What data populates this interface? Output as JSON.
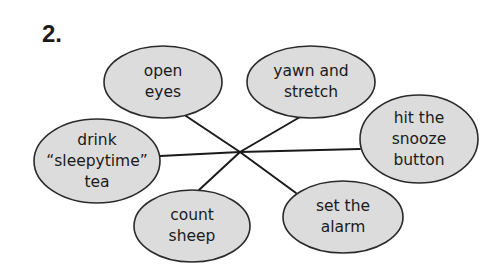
{
  "exercise": {
    "number": "2."
  },
  "colors": {
    "background": "#ffffff",
    "node_fill": "#dcdcdc",
    "node_stroke": "#2a2a2a",
    "line": "#1a1a1a",
    "text": "#1a1a1a"
  },
  "center": {
    "x": 240,
    "y": 152
  },
  "nodes": [
    {
      "id": "open-eyes",
      "lines": [
        "open",
        "eyes"
      ],
      "cx": 163,
      "cy": 82,
      "rx": 59,
      "ry": 36,
      "connect": {
        "x": 186,
        "y": 116
      }
    },
    {
      "id": "yawn-and-stretch",
      "lines": [
        "yawn and",
        "stretch"
      ],
      "cx": 311,
      "cy": 82,
      "rx": 64,
      "ry": 36,
      "connect": {
        "x": 300,
        "y": 117
      }
    },
    {
      "id": "drink-sleepytime-tea",
      "lines": [
        "drink",
        "“sleepytime”",
        "tea"
      ],
      "cx": 97,
      "cy": 161,
      "rx": 63,
      "ry": 42,
      "connect": {
        "x": 160,
        "y": 156
      }
    },
    {
      "id": "hit-the-snooze-button",
      "lines": [
        "hit the",
        "snooze",
        "button"
      ],
      "cx": 419,
      "cy": 139,
      "rx": 59,
      "ry": 44,
      "connect": {
        "x": 360,
        "y": 149
      }
    },
    {
      "id": "count-sheep",
      "lines": [
        "count",
        "sheep"
      ],
      "cx": 192,
      "cy": 226,
      "rx": 58,
      "ry": 36,
      "connect": {
        "x": 199,
        "y": 190
      }
    },
    {
      "id": "set-the-alarm",
      "lines": [
        "set the",
        "alarm"
      ],
      "cx": 343,
      "cy": 217,
      "rx": 60,
      "ry": 36,
      "connect": {
        "x": 296,
        "y": 193
      }
    }
  ]
}
